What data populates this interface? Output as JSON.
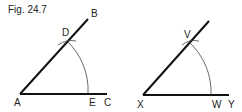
{
  "caption": "Fig. 24.7",
  "figure_left": {
    "labels": {
      "A": "A",
      "B": "B",
      "C": "C",
      "D": "D",
      "E": "E"
    }
  },
  "figure_right": {
    "labels": {
      "X": "X",
      "Y": "Y",
      "V": "V",
      "W": "W"
    }
  },
  "colors": {
    "line": "#111111",
    "arc": "#444444",
    "text": "#222222"
  }
}
